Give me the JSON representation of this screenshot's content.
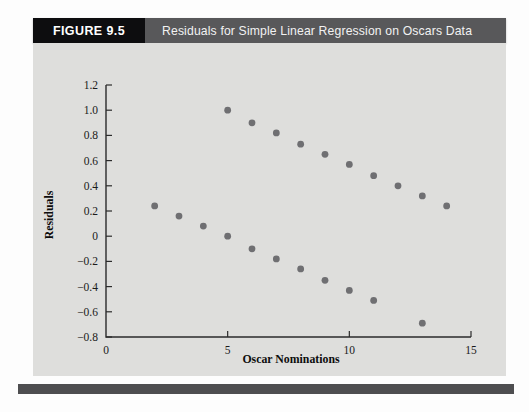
{
  "figure": {
    "number_label": "FIGURE 9.5",
    "caption": "Residuals for Simple Linear Regression on Oscars Data"
  },
  "chart_data": {
    "type": "scatter",
    "title": "Residuals for Simple Linear Regression on Oscars Data",
    "xlabel": "Oscar Nominations",
    "ylabel": "Residuals",
    "xlim": [
      0,
      15
    ],
    "ylim": [
      -0.8,
      1.2
    ],
    "xticks": [
      0,
      5,
      10,
      15
    ],
    "xtick_labels": [
      "0",
      "5",
      "10",
      "15"
    ],
    "yticks": [
      -0.8,
      -0.6,
      -0.4,
      -0.2,
      0,
      0.2,
      0.4,
      0.6,
      0.8,
      1.0,
      1.2
    ],
    "ytick_labels": [
      "-0.8",
      "-0.6",
      "-0.4",
      "-0.2",
      "0",
      "0.2",
      "0.4",
      "0.6",
      "0.8",
      "1.0",
      "1.2"
    ],
    "grid": false,
    "legend": "none",
    "marker": "filled-circle",
    "marker_color": "#6f6f72",
    "series": [
      {
        "name": "upper-band",
        "points": [
          {
            "x": 2,
            "y": 0.24
          },
          {
            "x": 3,
            "y": 0.16
          },
          {
            "x": 4,
            "y": 0.08
          },
          {
            "x": 5,
            "y": 1.0
          },
          {
            "x": 5,
            "y": 0.0
          },
          {
            "x": 6,
            "y": 0.9
          },
          {
            "x": 6,
            "y": -0.1
          },
          {
            "x": 7,
            "y": 0.82
          },
          {
            "x": 7,
            "y": -0.18
          },
          {
            "x": 8,
            "y": 0.73
          },
          {
            "x": 8,
            "y": -0.26
          },
          {
            "x": 9,
            "y": 0.65
          },
          {
            "x": 9,
            "y": -0.35
          },
          {
            "x": 10,
            "y": 0.57
          },
          {
            "x": 10,
            "y": -0.43
          },
          {
            "x": 11,
            "y": 0.48
          },
          {
            "x": 11,
            "y": -0.51
          },
          {
            "x": 12,
            "y": 0.4
          },
          {
            "x": 13,
            "y": 0.32
          },
          {
            "x": 13,
            "y": -0.69
          },
          {
            "x": 14,
            "y": 0.24
          }
        ]
      }
    ]
  }
}
